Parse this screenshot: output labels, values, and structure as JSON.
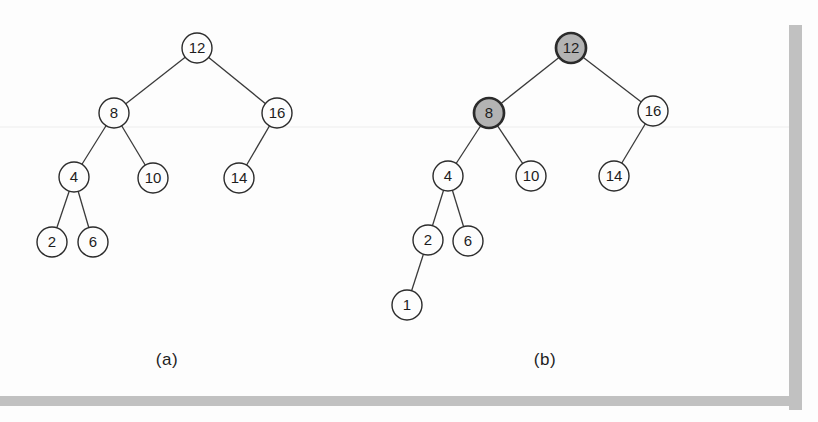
{
  "colors": {
    "paper": "#fdfdfd",
    "frame_gray": "#c1c1c1",
    "edge": "#3a3a3a",
    "node_stroke": "#2b2b2b",
    "node_fill": "#fdfdfd",
    "highlight_fill": "#b3b3b3",
    "text": "#1d1d1d"
  },
  "node_style": {
    "radius": 15,
    "stroke_width": 1.4,
    "highlight_stroke_width": 2.7,
    "edge_width": 1.3,
    "font_size": 15
  },
  "figures": [
    {
      "id": "a",
      "label": "(a)",
      "nodes": [
        {
          "value": "12",
          "x": 197,
          "y": 48,
          "highlighted": false
        },
        {
          "value": "8",
          "x": 114,
          "y": 113,
          "highlighted": false
        },
        {
          "value": "16",
          "x": 277,
          "y": 113,
          "highlighted": false
        },
        {
          "value": "4",
          "x": 74,
          "y": 177,
          "highlighted": false
        },
        {
          "value": "10",
          "x": 153,
          "y": 178,
          "highlighted": false
        },
        {
          "value": "14",
          "x": 239,
          "y": 178,
          "highlighted": false
        },
        {
          "value": "2",
          "x": 52,
          "y": 242,
          "highlighted": false
        },
        {
          "value": "6",
          "x": 93,
          "y": 242,
          "highlighted": false
        }
      ],
      "edges": [
        [
          "12",
          "8"
        ],
        [
          "12",
          "16"
        ],
        [
          "8",
          "4"
        ],
        [
          "8",
          "10"
        ],
        [
          "16",
          "14"
        ],
        [
          "4",
          "2"
        ],
        [
          "4",
          "6"
        ]
      ]
    },
    {
      "id": "b",
      "label": "(b)",
      "nodes": [
        {
          "value": "12",
          "x": 571,
          "y": 48,
          "highlighted": true
        },
        {
          "value": "8",
          "x": 489,
          "y": 113,
          "highlighted": true
        },
        {
          "value": "16",
          "x": 653,
          "y": 111,
          "highlighted": false
        },
        {
          "value": "4",
          "x": 448,
          "y": 176,
          "highlighted": false
        },
        {
          "value": "10",
          "x": 531,
          "y": 176,
          "highlighted": false
        },
        {
          "value": "14",
          "x": 614,
          "y": 176,
          "highlighted": false
        },
        {
          "value": "2",
          "x": 428,
          "y": 240,
          "highlighted": false
        },
        {
          "value": "6",
          "x": 468,
          "y": 241,
          "highlighted": false
        },
        {
          "value": "1",
          "x": 407,
          "y": 305,
          "highlighted": false
        }
      ],
      "edges": [
        [
          "12",
          "8"
        ],
        [
          "12",
          "16"
        ],
        [
          "8",
          "4"
        ],
        [
          "8",
          "10"
        ],
        [
          "16",
          "14"
        ],
        [
          "4",
          "2"
        ],
        [
          "4",
          "6"
        ],
        [
          "2",
          "1"
        ]
      ]
    }
  ]
}
